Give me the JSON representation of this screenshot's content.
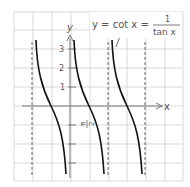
{
  "figure": {
    "title_equation": {
      "lhs": "y = cot x =",
      "numerator": "1",
      "denominator": "tan x"
    },
    "axes": {
      "x_label": "x",
      "y_label": "y",
      "y_ticks": [
        "1",
        "2",
        "3"
      ],
      "x_tick_label": "π/2",
      "x_tick_num": "π",
      "x_tick_den": "2"
    },
    "colors": {
      "grid": "#cccccc",
      "axis": "#777777",
      "curve": "#111111",
      "asymptote": "#555555",
      "text": "#555555"
    },
    "function": "cot",
    "asymptotes": [
      "-π/2",
      "π/2",
      "3π/2"
    ],
    "zeros": [
      "-π/2 + ... ",
      "0 + π/2",
      "π"
    ]
  }
}
